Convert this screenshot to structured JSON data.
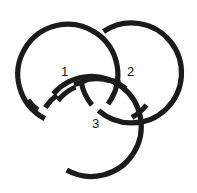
{
  "figure": {
    "background_color": "#ffffff",
    "stroke_color": "#1b1b1b",
    "stroke_width": 5.2,
    "canvas": {
      "width": 197,
      "height": 193
    }
  },
  "labels": {
    "ring_1": "1",
    "ring_2": "2",
    "ring_3": "3"
  },
  "rings": [
    {
      "id": "ring-1",
      "label": "1",
      "position": "upper-left",
      "center_x": 62,
      "center_y": 72,
      "radius": 50,
      "label_x": 66,
      "label_y": 72
    },
    {
      "id": "ring-2",
      "label": "2",
      "position": "upper-right",
      "center_x": 128,
      "center_y": 72,
      "radius": 50,
      "label_x": 132,
      "label_y": 72
    },
    {
      "id": "ring-3",
      "label": "3",
      "position": "bottom-center",
      "center_x": 95,
      "center_y": 129,
      "radius": 50,
      "label_x": 97,
      "label_y": 124
    }
  ],
  "crossings": [
    {
      "id": "top-center",
      "over": "ring-1",
      "under": "ring-2",
      "x": 97,
      "y": 27
    },
    {
      "id": "inner-upper",
      "over": "ring-2",
      "under": "ring-1",
      "x": 95,
      "y": 90
    },
    {
      "id": "left-outer",
      "over": "ring-3",
      "under": "ring-1",
      "x": 50,
      "y": 101
    },
    {
      "id": "inner-left",
      "over": "ring-1",
      "under": "ring-3",
      "x": 80,
      "y": 80
    },
    {
      "id": "right-outer",
      "over": "ring-2",
      "under": "ring-3",
      "x": 140,
      "y": 101
    },
    {
      "id": "inner-right",
      "over": "ring-3",
      "under": "ring-2",
      "x": 112,
      "y": 80
    }
  ]
}
